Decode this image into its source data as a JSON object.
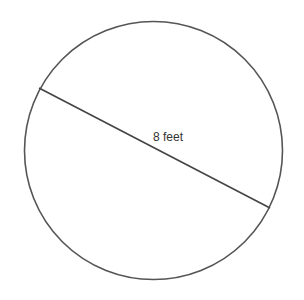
{
  "diagram": {
    "type": "circle-with-diameter",
    "canvas": {
      "width": 304,
      "height": 300,
      "background": "#ffffff"
    },
    "circle": {
      "cx": 153.5,
      "cy": 150.5,
      "r": 129,
      "stroke": "#555555",
      "stroke_width": 1.6
    },
    "diameter": {
      "x1": 39,
      "y1": 88,
      "x2": 270,
      "y2": 208,
      "stroke": "#444444",
      "stroke_width": 1.6
    },
    "label": {
      "text": "8 feet",
      "x": 168,
      "y": 141,
      "color": "#333333"
    }
  }
}
